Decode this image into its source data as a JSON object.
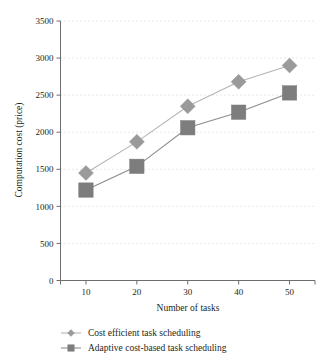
{
  "chart_data": {
    "type": "line",
    "title": "",
    "xlabel": "Number of tasks",
    "ylabel": "Computation cost (price)",
    "x": [
      10,
      20,
      30,
      40,
      50
    ],
    "xtick_labels": [
      "10",
      "20",
      "30",
      "40",
      "50"
    ],
    "ytick_labels": [
      "0",
      "500",
      "1000",
      "1500",
      "2000",
      "2500",
      "3000",
      "3500"
    ],
    "ytick_values": [
      0,
      500,
      1000,
      1500,
      2000,
      2500,
      3000,
      3500
    ],
    "xlim": [
      5,
      55
    ],
    "ylim": [
      0,
      3500
    ],
    "grid": "horizontal-dotted",
    "legend_position": "below-axes",
    "series": [
      {
        "name": "Cost efficient task scheduling",
        "marker": "diamond",
        "color": "#9a9a9a",
        "line_color": "#b4b4b4",
        "values": [
          1450,
          1870,
          2350,
          2680,
          2900
        ]
      },
      {
        "name": "Adaptive cost-based task scheduling",
        "marker": "square",
        "color": "#7d7d7d",
        "line_color": "#8c8c8c",
        "values": [
          1220,
          1540,
          2060,
          2270,
          2530
        ]
      }
    ]
  },
  "legend": {
    "items": [
      {
        "label": "Cost efficient task scheduling"
      },
      {
        "label": "Adaptive cost-based task scheduling"
      }
    ]
  },
  "colors": {
    "axis": "#6d6d6d",
    "grid": "#d9c9c9",
    "text": "#231f20"
  }
}
